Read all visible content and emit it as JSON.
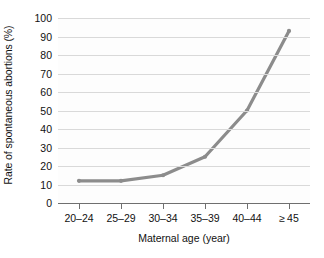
{
  "chart_data": {
    "type": "line",
    "title": "",
    "xlabel": "Maternal age (year)",
    "ylabel": "Rate of spontaneous abortions (%)",
    "categories": [
      "20–24",
      "25–29",
      "30–34",
      "35–39",
      "40–44",
      "≥ 45"
    ],
    "values": [
      12,
      12,
      15,
      25,
      50,
      93
    ],
    "series": [
      {
        "name": "Rate of spontaneous abortions",
        "values": [
          12,
          12,
          15,
          25,
          50,
          93
        ]
      }
    ],
    "ylim": [
      0,
      100
    ],
    "ytick_labels": [
      "0",
      "10",
      "20",
      "30",
      "40",
      "50",
      "60",
      "70",
      "80",
      "90",
      "100"
    ],
    "ytick_values": [
      0,
      10,
      20,
      30,
      40,
      50,
      60,
      70,
      80,
      90,
      100
    ],
    "grid": "horizontal",
    "legend": "none",
    "line_color": "#8c8c8c",
    "grid_color": "#d9d9d9",
    "axis_color": "#6f6f6f",
    "background_color": "#ffffff",
    "plot_background_color": "#fdfdfd"
  }
}
